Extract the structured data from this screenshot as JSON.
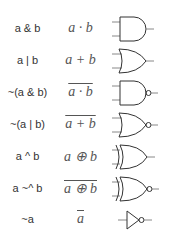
{
  "rows": [
    {
      "code": "a & b",
      "expr": "a · b",
      "negated": false,
      "gate": "AND"
    },
    {
      "code": "a | b",
      "expr": "a + b",
      "negated": false,
      "gate": "OR"
    },
    {
      "code": "~(a & b)",
      "expr": "a · b",
      "negated": true,
      "gate": "NAND"
    },
    {
      "code": "~(a | b)",
      "expr": "a + b",
      "negated": true,
      "gate": "NOR"
    },
    {
      "code": "a ^ b",
      "expr": "a ⊕ b",
      "negated": false,
      "gate": "XOR"
    },
    {
      "code": "a ~^ b",
      "expr": "a ⊕ b",
      "negated": true,
      "gate": "XNOR"
    },
    {
      "code": "~a",
      "expr": "a",
      "negated": true,
      "gate": "NOT"
    }
  ]
}
